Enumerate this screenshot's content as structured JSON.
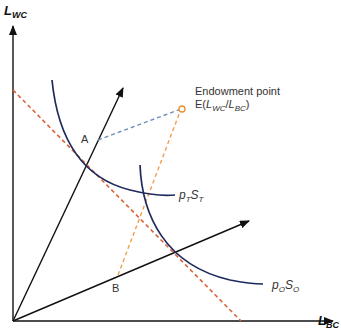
{
  "axes": {
    "y_label": "L",
    "y_sub": "WC",
    "x_label": "L",
    "x_sub": "BC"
  },
  "points": {
    "A": "A",
    "B": "B"
  },
  "endowment": {
    "title": "Endowment point",
    "prefix": "E(",
    "l1": "L",
    "s1": "WC",
    "slash": "/",
    "l2": "L",
    "s2": "BC",
    "suffix": ")"
  },
  "curves": {
    "pt_p": "p",
    "pt_ps": "T",
    "pt_s": "S",
    "pt_ss": "T",
    "po_p": "p",
    "po_ps": "O",
    "po_s": "S",
    "po_ss": "O"
  },
  "colors": {
    "axis": "#111111",
    "isoquant": "#1f2a5c",
    "budget_line": "#d9643c",
    "endowment_line_A": "#6a8fbf",
    "endowment_line_B": "#f0a050",
    "endowment_marker": "#e8902a"
  }
}
